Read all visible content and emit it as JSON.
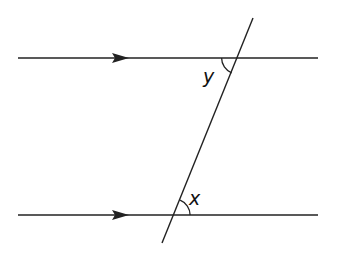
{
  "diagram": {
    "type": "parallel-lines-transversal",
    "canvas": {
      "width": 338,
      "height": 265,
      "background": "#ffffff"
    },
    "stroke_color": "#222222",
    "lines": {
      "top_parallel": {
        "x1": 18,
        "y1": 58,
        "x2": 318,
        "y2": 58,
        "arrow_at_x": 122
      },
      "bottom_parallel": {
        "x1": 18,
        "y1": 215,
        "x2": 318,
        "y2": 215,
        "arrow_at_x": 122
      },
      "transversal": {
        "x1": 253,
        "y1": 18,
        "x2": 162,
        "y2": 243
      }
    },
    "angles": [
      {
        "name": "y",
        "label": "y",
        "position": "top intersection, lower-left (alternate interior)"
      },
      {
        "name": "x",
        "label": "x",
        "position": "bottom intersection, upper-right (alternate interior)"
      }
    ]
  }
}
